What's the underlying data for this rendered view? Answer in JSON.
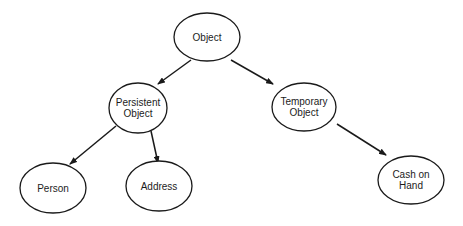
{
  "diagram": {
    "type": "class-hierarchy-tree",
    "nodes": [
      {
        "id": "object",
        "lines": [
          "Object"
        ],
        "cx": 207,
        "cy": 37,
        "rx": 33,
        "ry": 24
      },
      {
        "id": "persistent-object",
        "lines": [
          "Persistent",
          "Object"
        ],
        "cx": 138,
        "cy": 108,
        "rx": 29,
        "ry": 25
      },
      {
        "id": "temporary-object",
        "lines": [
          "Temporary",
          "Object"
        ],
        "cx": 304,
        "cy": 107,
        "rx": 32,
        "ry": 24
      },
      {
        "id": "person",
        "lines": [
          "Person"
        ],
        "cx": 53,
        "cy": 188,
        "rx": 33,
        "ry": 25
      },
      {
        "id": "address",
        "lines": [
          "Address"
        ],
        "cx": 159,
        "cy": 186,
        "rx": 33,
        "ry": 25
      },
      {
        "id": "cash-on-hand",
        "lines": [
          "Cash on",
          "Hand"
        ],
        "cx": 411,
        "cy": 180,
        "rx": 33,
        "ry": 24
      }
    ],
    "edges": [
      {
        "from": "object",
        "to": "persistent-object",
        "x1": 191,
        "y1": 60,
        "x2": 158,
        "y2": 84
      },
      {
        "from": "object",
        "to": "temporary-object",
        "x1": 231,
        "y1": 60,
        "x2": 273,
        "y2": 84
      },
      {
        "from": "persistent-object",
        "to": "person",
        "x1": 116,
        "y1": 126,
        "x2": 70,
        "y2": 164
      },
      {
        "from": "persistent-object",
        "to": "address",
        "x1": 151,
        "y1": 131,
        "x2": 158,
        "y2": 163
      },
      {
        "from": "temporary-object",
        "to": "cash-on-hand",
        "x1": 337,
        "y1": 124,
        "x2": 386,
        "y2": 155
      }
    ],
    "colors": {
      "stroke": "#1a1a1a",
      "text": "#1c1c1c",
      "background": "#ffffff"
    }
  }
}
